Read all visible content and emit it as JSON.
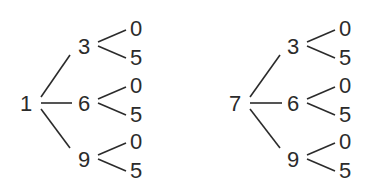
{
  "diagram": {
    "type": "tree-diagrams",
    "trees": [
      {
        "root": "1",
        "branches": [
          {
            "label": "3",
            "leaves": [
              "0",
              "5"
            ]
          },
          {
            "label": "6",
            "leaves": [
              "0",
              "5"
            ]
          },
          {
            "label": "9",
            "leaves": [
              "0",
              "5"
            ]
          }
        ]
      },
      {
        "root": "7",
        "branches": [
          {
            "label": "3",
            "leaves": [
              "0",
              "5"
            ]
          },
          {
            "label": "6",
            "leaves": [
              "0",
              "5"
            ]
          },
          {
            "label": "9",
            "leaves": [
              "0",
              "5"
            ]
          }
        ]
      }
    ]
  }
}
